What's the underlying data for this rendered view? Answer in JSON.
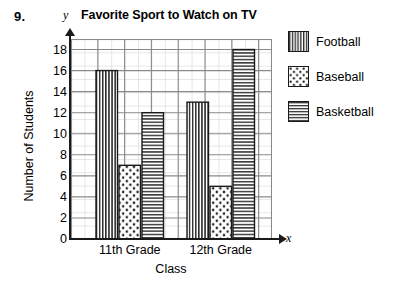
{
  "problem": {
    "number": "9."
  },
  "chart_data": {
    "type": "bar",
    "title": "Favorite Sport to Watch on TV",
    "xlabel": "Class",
    "ylabel": "Number of Students",
    "x_axis_letter": "x",
    "y_axis_letter": "y",
    "categories": [
      "11th Grade",
      "12th Grade"
    ],
    "series": [
      {
        "name": "Football",
        "values": [
          16,
          13
        ],
        "pattern": "vertical-stripes"
      },
      {
        "name": "Baseball",
        "values": [
          7,
          5
        ],
        "pattern": "dots"
      },
      {
        "name": "Basketball",
        "values": [
          12,
          18
        ],
        "pattern": "horizontal-stripes"
      }
    ],
    "ylim": [
      0,
      19
    ],
    "yticks": [
      0,
      2,
      4,
      6,
      8,
      10,
      12,
      14,
      16,
      18
    ],
    "ytick_labels": [
      "0",
      "2",
      "4",
      "6",
      "8",
      "10",
      "12",
      "14",
      "16",
      "18"
    ],
    "grid": true,
    "grid_minor": true,
    "legend_position": "right",
    "colors": {
      "axis": "#1a1a1a",
      "grid_major": "#8c8c8c",
      "grid_minor": "#c8c8c8",
      "bar_outline": "#1a1a1a",
      "bar_fill": "#ffffff",
      "pattern": "#2b2b2b",
      "background": "#ffffff"
    }
  },
  "legend": {
    "items": [
      {
        "label": "Football",
        "swatch": "vertical-stripe-swatch"
      },
      {
        "label": "Baseball",
        "swatch": "dot-pattern-swatch"
      },
      {
        "label": "Basketball",
        "swatch": "horizontal-stripe-swatch"
      }
    ]
  }
}
